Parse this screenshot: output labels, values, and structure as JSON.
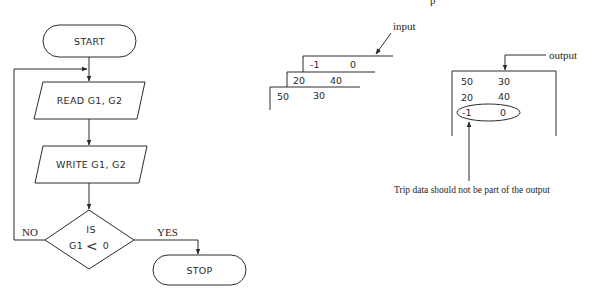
{
  "flowchart": {
    "start_label": "START",
    "read_label": "READ G1, G2",
    "write_label": "WRITE G1, G2",
    "decision": {
      "line1": "IS",
      "line2_left": "G1",
      "line2_op": "<",
      "line2_right": "0"
    },
    "no_label": "NO",
    "yes_label": "YES",
    "stop_label": "STOP"
  },
  "input_deck": {
    "label": "input",
    "cards": [
      {
        "g1": "-1",
        "g2": "0"
      },
      {
        "g1": "20",
        "g2": "40"
      },
      {
        "g1": "50",
        "g2": "30"
      }
    ]
  },
  "output_box": {
    "label": "output",
    "rows": [
      {
        "g1": "50",
        "g2": "30"
      },
      {
        "g1": "20",
        "g2": "40"
      },
      {
        "g1": "-1",
        "g2": "0"
      }
    ]
  },
  "caption": "Trip data should not be part of the output",
  "top_fragment": "p"
}
